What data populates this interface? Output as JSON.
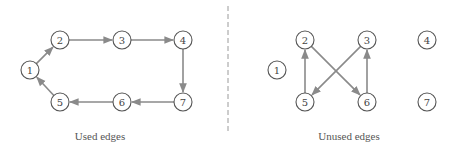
{
  "diagram": {
    "colors": {
      "edge": "#8a8a8a",
      "node_stroke": "#555555",
      "label": "#444444",
      "divider": "#9a9a9a"
    },
    "node_radius": 9,
    "panels": [
      {
        "id": "used",
        "caption": "Used edges",
        "caption_pos": [
          100,
          140
        ],
        "nodes": [
          {
            "id": "1",
            "label": "1",
            "x": 30,
            "y": 70
          },
          {
            "id": "2",
            "label": "2",
            "x": 60,
            "y": 40
          },
          {
            "id": "3",
            "label": "3",
            "x": 122,
            "y": 40
          },
          {
            "id": "4",
            "label": "4",
            "x": 183,
            "y": 40
          },
          {
            "id": "5",
            "label": "5",
            "x": 60,
            "y": 102
          },
          {
            "id": "6",
            "label": "6",
            "x": 122,
            "y": 102
          },
          {
            "id": "7",
            "label": "7",
            "x": 183,
            "y": 102
          }
        ],
        "edges": [
          {
            "from": "1",
            "to": "2"
          },
          {
            "from": "2",
            "to": "3"
          },
          {
            "from": "3",
            "to": "4"
          },
          {
            "from": "4",
            "to": "7"
          },
          {
            "from": "7",
            "to": "6"
          },
          {
            "from": "6",
            "to": "5"
          },
          {
            "from": "5",
            "to": "1"
          }
        ]
      },
      {
        "id": "unused",
        "caption": "Unused edges",
        "caption_pos": [
          349,
          140
        ],
        "nodes": [
          {
            "id": "1",
            "label": "1",
            "x": 277,
            "y": 70
          },
          {
            "id": "2",
            "label": "2",
            "x": 305,
            "y": 40
          },
          {
            "id": "3",
            "label": "3",
            "x": 367,
            "y": 40
          },
          {
            "id": "4",
            "label": "4",
            "x": 427,
            "y": 40
          },
          {
            "id": "5",
            "label": "5",
            "x": 305,
            "y": 102
          },
          {
            "id": "6",
            "label": "6",
            "x": 367,
            "y": 102
          },
          {
            "id": "7",
            "label": "7",
            "x": 427,
            "y": 102
          }
        ],
        "edges": [
          {
            "from": "5",
            "to": "2"
          },
          {
            "from": "2",
            "to": "6"
          },
          {
            "from": "3",
            "to": "5"
          },
          {
            "from": "6",
            "to": "3"
          }
        ]
      }
    ],
    "divider": {
      "x": 228,
      "y1": 6,
      "y2": 134
    }
  }
}
